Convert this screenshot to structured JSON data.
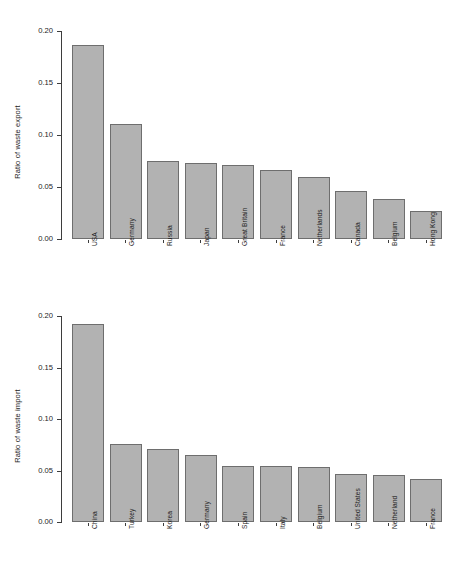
{
  "chart_data": [
    {
      "type": "bar",
      "title": "",
      "xlabel": "",
      "ylabel": "Ratio of waste export",
      "ylim": [
        0,
        0.2
      ],
      "yticks": [
        "0.00",
        "0.05",
        "0.10",
        "0.15",
        "0.20"
      ],
      "ytick_values": [
        0.0,
        0.05,
        0.1,
        0.15,
        0.2
      ],
      "grid": false,
      "legend": "none",
      "bar_color": "#b2b2b2",
      "bar_border_color": "#6e6e6e",
      "categories": [
        "USA",
        "Germany",
        "Russia",
        "Japan",
        "Great Britain",
        "France",
        "Netherlands",
        "Canada",
        "Belgium",
        "Hong Kong"
      ],
      "values": [
        0.187,
        0.111,
        0.075,
        0.073,
        0.071,
        0.066,
        0.06,
        0.046,
        0.038,
        0.027
      ]
    },
    {
      "type": "bar",
      "title": "",
      "xlabel": "",
      "ylabel": "Ratio of waste import",
      "ylim": [
        0,
        0.2
      ],
      "yticks": [
        "0.00",
        "0.05",
        "0.10",
        "0.15",
        "0.20"
      ],
      "ytick_values": [
        0.0,
        0.05,
        0.1,
        0.15,
        0.2
      ],
      "grid": false,
      "legend": "none",
      "bar_color": "#b2b2b2",
      "bar_border_color": "#6e6e6e",
      "categories": [
        "China",
        "Turkey",
        "Korea",
        "Germany",
        "Spain",
        "Italy",
        "Belgium",
        "United States",
        "Netherland",
        "France"
      ],
      "values": [
        0.192,
        0.076,
        0.071,
        0.065,
        0.054,
        0.054,
        0.053,
        0.047,
        0.046,
        0.042
      ]
    }
  ]
}
